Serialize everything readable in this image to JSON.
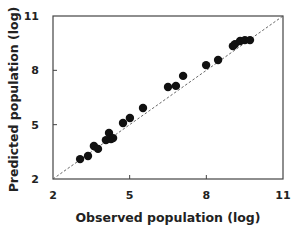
{
  "chart_data": {
    "type": "scatter",
    "title": "",
    "xlabel": "Observed population (log)",
    "ylabel": "Predicted population (log)",
    "xlim": [
      2,
      11
    ],
    "ylim": [
      2,
      11
    ],
    "xticks": [
      2,
      5,
      8,
      11
    ],
    "yticks": [
      2,
      5,
      8,
      11
    ],
    "grid": false,
    "legend": null,
    "reference_line": {
      "type": "y=x",
      "style": "dashed",
      "color": "#555555"
    },
    "marker": {
      "shape": "circle",
      "color": "#111111"
    },
    "series": [
      {
        "name": "Observed vs Predicted",
        "points": [
          {
            "x": 3.06,
            "y": 3.1
          },
          {
            "x": 3.37,
            "y": 3.27
          },
          {
            "x": 3.6,
            "y": 3.82
          },
          {
            "x": 3.76,
            "y": 3.66
          },
          {
            "x": 4.07,
            "y": 4.15
          },
          {
            "x": 4.19,
            "y": 4.54
          },
          {
            "x": 4.27,
            "y": 4.21
          },
          {
            "x": 4.35,
            "y": 4.26
          },
          {
            "x": 4.74,
            "y": 5.09
          },
          {
            "x": 5.01,
            "y": 5.37
          },
          {
            "x": 5.52,
            "y": 5.92
          },
          {
            "x": 6.5,
            "y": 7.08
          },
          {
            "x": 6.81,
            "y": 7.14
          },
          {
            "x": 7.09,
            "y": 7.69
          },
          {
            "x": 7.99,
            "y": 8.29
          },
          {
            "x": 8.46,
            "y": 8.57
          },
          {
            "x": 9.04,
            "y": 9.34
          },
          {
            "x": 9.12,
            "y": 9.45
          },
          {
            "x": 9.32,
            "y": 9.62
          },
          {
            "x": 9.51,
            "y": 9.67
          },
          {
            "x": 9.71,
            "y": 9.67
          }
        ]
      }
    ]
  },
  "colors": {
    "axis": "#444444",
    "marker": "#111111",
    "reference_line": "#555555",
    "text": "#222222"
  }
}
